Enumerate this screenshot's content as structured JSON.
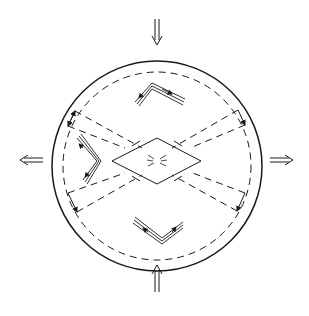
{
  "diagram": {
    "colors": {
      "stroke": "#1a1a1a",
      "background": "#ffffff"
    },
    "arrows": [
      {
        "name": "compression-top",
        "direction": "down"
      },
      {
        "name": "compression-bottom",
        "direction": "up"
      },
      {
        "name": "extension-left",
        "direction": "left"
      },
      {
        "name": "extension-right",
        "direction": "right"
      }
    ],
    "elements": [
      "outer-circle",
      "inner-dashed-circle",
      "central-rhombus",
      "conjugate-shear-bands",
      "fold-top",
      "fold-bottom",
      "fold-left"
    ]
  }
}
